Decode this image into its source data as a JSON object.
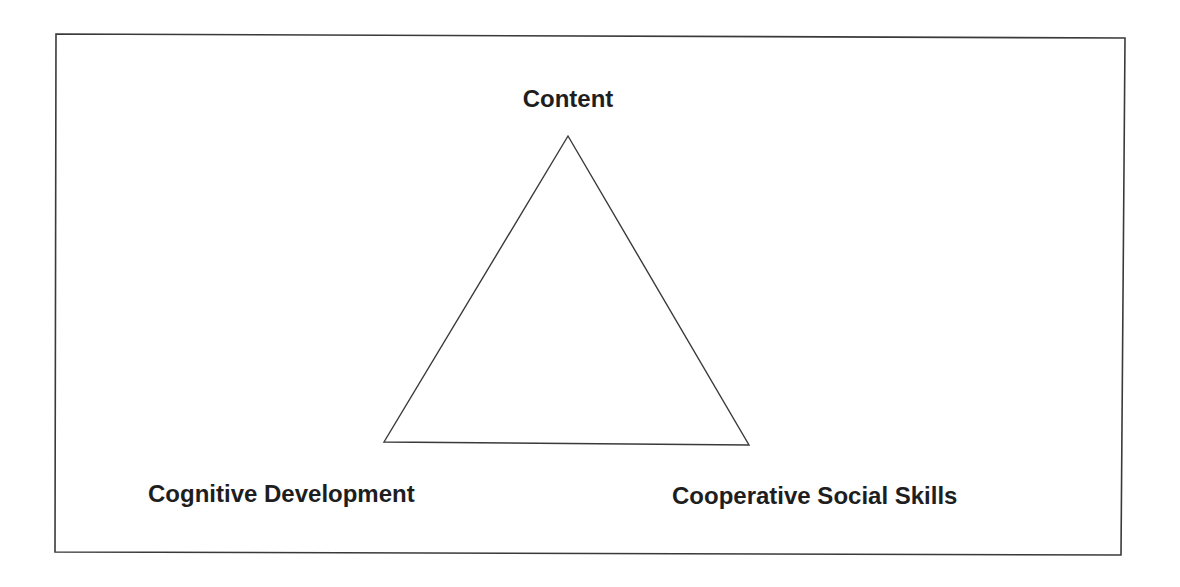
{
  "diagram": {
    "type": "triangle",
    "colors": {
      "line": "#3a3a3a",
      "text": "#1e1e1e",
      "background": "#ffffff"
    },
    "vertices": {
      "top": {
        "label": "Content",
        "x": 568,
        "y": 136
      },
      "bottom_left": {
        "label": "Cognitive Development",
        "x": 384,
        "y": 442
      },
      "bottom_right": {
        "label": "Cooperative Social Skills",
        "x": 749,
        "y": 445
      }
    }
  }
}
